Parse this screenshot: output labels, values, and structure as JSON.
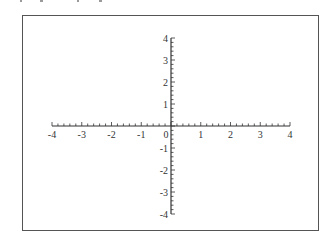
{
  "chart_data": {
    "type": "line",
    "title": "",
    "xlabel": "",
    "ylabel": "",
    "xlim": [
      -4,
      4
    ],
    "ylim": [
      -4,
      4
    ],
    "x_ticks": [
      "-4",
      "-3",
      "-2",
      "-1",
      "0",
      "1",
      "2",
      "3",
      "4"
    ],
    "y_ticks": [
      "4",
      "3",
      "2",
      "1",
      "-1",
      "-2",
      "-3",
      "-4"
    ],
    "minor_ticks_per_unit": 5,
    "grid": false,
    "legend": null,
    "series": []
  },
  "colors": {
    "axis": "#333333",
    "frame": "#555555",
    "background": "#ffffff"
  }
}
